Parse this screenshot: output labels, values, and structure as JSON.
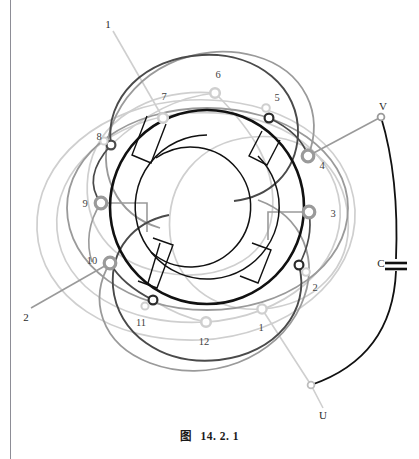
{
  "figure": {
    "caption_prefix": "图",
    "caption_number": "14. 2. 1",
    "kind": "stator-winding-diagram"
  },
  "colors": {
    "core": "#111111",
    "phase_dark": "#4a4a4a",
    "phase_mid": "#9a9a9a",
    "phase_light": "#cfcfcf",
    "label_text": "#3a3a3a",
    "page_rule": "#8d8d96",
    "background": "#ffffff"
  },
  "geometry": {
    "center_x": 207,
    "center_y": 207,
    "core_outer_radius": 97,
    "core_inner_radius": 72,
    "coil_band_radius": 60
  },
  "coil_slots": {
    "count": 12,
    "label": "12 槽"
  },
  "terminals": [
    {
      "id": "t1",
      "label": "1",
      "x": 262,
      "y": 309,
      "lx": 261,
      "ly": 327,
      "tone": "light",
      "size": "small"
    },
    {
      "id": "t2",
      "label": "2",
      "x": 299,
      "y": 265,
      "lx": 317,
      "ly": 288,
      "tone": "dark",
      "size": "small"
    },
    {
      "id": "t3",
      "label": "3",
      "x": 309,
      "y": 212,
      "lx": 333,
      "ly": 215,
      "tone": "mid",
      "size": "large"
    },
    {
      "id": "t4",
      "label": "4",
      "x": 308,
      "y": 156,
      "lx": 322,
      "ly": 165,
      "tone": "mid",
      "size": "large"
    },
    {
      "id": "t5",
      "label": "5",
      "x": 269,
      "y": 118,
      "lx": 277,
      "ly": 99,
      "tone": "dark",
      "size": "small"
    },
    {
      "id": "t6",
      "label": "6",
      "x": 215,
      "y": 93,
      "lx": 218,
      "ly": 76,
      "tone": "light",
      "size": "small"
    },
    {
      "id": "t7",
      "label": "7",
      "x": 163,
      "y": 118,
      "lx": 164,
      "ly": 98,
      "tone": "light",
      "size": "small"
    },
    {
      "id": "t8",
      "label": "8",
      "x": 111,
      "y": 145,
      "lx": 100,
      "ly": 137,
      "tone": "light",
      "size": "small"
    },
    {
      "id": "t9",
      "label": "9",
      "x": 101,
      "y": 203,
      "lx": 86,
      "ly": 203,
      "tone": "mid",
      "size": "large"
    },
    {
      "id": "t10",
      "label": "10",
      "x": 110,
      "y": 263,
      "lx": 92,
      "ly": 260,
      "tone": "mid",
      "size": "large"
    },
    {
      "id": "t11",
      "label": "11",
      "x": 153,
      "y": 300,
      "lx": 141,
      "ly": 323,
      "tone": "dark",
      "size": "small"
    },
    {
      "id": "t12",
      "label": "12",
      "x": 206,
      "y": 322,
      "lx": 204,
      "ly": 342,
      "tone": "light",
      "size": "small"
    }
  ],
  "phase_leads": [
    {
      "id": "lead-U",
      "label": "U",
      "x": 323,
      "y": 415,
      "node_x": 311,
      "node_y": 385,
      "tone": "light"
    },
    {
      "id": "lead-V",
      "label": "V",
      "x": 383,
      "y": 107,
      "node_x": 381,
      "node_y": 117,
      "tone": "mid"
    },
    {
      "id": "lead-1",
      "label": "1",
      "x": 108,
      "y": 24,
      "node_x": 113,
      "node_y": 31,
      "tone": "light"
    },
    {
      "id": "lead-2",
      "label": "2",
      "x": 26,
      "y": 317,
      "node_x": 31,
      "node_y": 308,
      "tone": "mid"
    }
  ],
  "capacitor": {
    "id": "cap-C",
    "label": "C",
    "label_x": 383,
    "label_y": 263,
    "plate_x": 396,
    "plate_y": 265,
    "plate_half_width": 11,
    "plate_gap": 5
  }
}
